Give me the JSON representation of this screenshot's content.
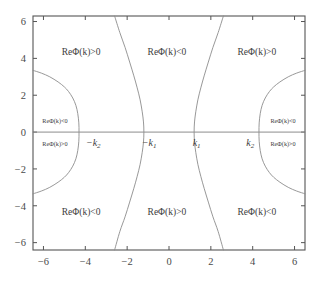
{
  "figure": {
    "kind": "sign-region-plot",
    "background_color": "#ffffff",
    "frame_color": "#555555",
    "curve_color": "#8c8c8c",
    "axis_color": "#8c8c8c",
    "text_color": "#3d3d3d"
  },
  "chart_data": {
    "type": "line",
    "title": "",
    "xlabel": "",
    "ylabel": "",
    "xlim": [
      -6.5,
      6.5
    ],
    "ylim": [
      -6.4,
      6.3
    ],
    "grid": false,
    "legend": "none",
    "xticks": [
      "-6",
      "-4",
      "-2",
      "0",
      "2",
      "4",
      "6"
    ],
    "xtick_values": [
      -6,
      -4,
      -2,
      0,
      2,
      4,
      6
    ],
    "yticks": [
      "6",
      "4",
      "2",
      "0",
      "-2",
      "-4",
      "-6"
    ],
    "ytick_values": [
      6,
      4,
      2,
      0,
      -2,
      -4,
      -6
    ],
    "series": [
      {
        "name": "left-arc",
        "description": "leftward-opening arc with vertex on the real axis near x=-4.3, meeting the left frame edge at y=+3.35 and y=-3.35",
        "points": [
          [
            -6.5,
            3.35
          ],
          [
            -6.1,
            3.2
          ],
          [
            -5.7,
            3.0
          ],
          [
            -5.3,
            2.72
          ],
          [
            -5.0,
            2.45
          ],
          [
            -4.8,
            2.2
          ],
          [
            -4.6,
            1.85
          ],
          [
            -4.45,
            1.45
          ],
          [
            -4.36,
            1.0
          ],
          [
            -4.31,
            0.5
          ],
          [
            -4.3,
            0.0
          ],
          [
            -4.31,
            -0.5
          ],
          [
            -4.36,
            -1.0
          ],
          [
            -4.45,
            -1.45
          ],
          [
            -4.6,
            -1.85
          ],
          [
            -4.8,
            -2.2
          ],
          [
            -5.0,
            -2.45
          ],
          [
            -5.3,
            -2.72
          ],
          [
            -5.7,
            -3.0
          ],
          [
            -6.1,
            -3.2
          ],
          [
            -6.5,
            -3.35
          ]
        ]
      },
      {
        "name": "inner-left-curve",
        "description": "S-shaped separatrix crossing the real axis at -k1 (x=-1.2), running to x=-2.55 at both top and bottom frame edges",
        "points": [
          [
            -2.6,
            6.3
          ],
          [
            -2.35,
            5.4
          ],
          [
            -2.1,
            4.6
          ],
          [
            -1.88,
            3.8
          ],
          [
            -1.68,
            3.05
          ],
          [
            -1.52,
            2.4
          ],
          [
            -1.38,
            1.75
          ],
          [
            -1.28,
            1.1
          ],
          [
            -1.22,
            0.55
          ],
          [
            -1.2,
            0.0
          ],
          [
            -1.22,
            -0.55
          ],
          [
            -1.28,
            -1.1
          ],
          [
            -1.38,
            -1.75
          ],
          [
            -1.52,
            -2.4
          ],
          [
            -1.68,
            -3.05
          ],
          [
            -1.88,
            -3.8
          ],
          [
            -2.1,
            -4.6
          ],
          [
            -2.35,
            -5.4
          ],
          [
            -2.6,
            -6.4
          ]
        ]
      },
      {
        "name": "inner-right-curve",
        "description": "S-shaped separatrix crossing the real axis at k1 (x=1.2), running to x=2.55 at both top and bottom frame edges",
        "points": [
          [
            2.6,
            6.3
          ],
          [
            2.35,
            5.4
          ],
          [
            2.1,
            4.6
          ],
          [
            1.88,
            3.8
          ],
          [
            1.68,
            3.05
          ],
          [
            1.52,
            2.4
          ],
          [
            1.38,
            1.75
          ],
          [
            1.28,
            1.1
          ],
          [
            1.22,
            0.55
          ],
          [
            1.2,
            0.0
          ],
          [
            1.22,
            -0.55
          ],
          [
            1.28,
            -1.1
          ],
          [
            1.38,
            -1.75
          ],
          [
            1.52,
            -2.4
          ],
          [
            1.68,
            -3.05
          ],
          [
            1.88,
            -3.8
          ],
          [
            2.1,
            -4.6
          ],
          [
            2.35,
            -5.4
          ],
          [
            2.6,
            -6.4
          ]
        ]
      },
      {
        "name": "right-arc",
        "description": "rightward-opening arc with vertex on the real axis near x=4.3, meeting the right frame edge at y=+3.35 and y=-3.35",
        "points": [
          [
            6.5,
            3.35
          ],
          [
            6.1,
            3.2
          ],
          [
            5.7,
            3.0
          ],
          [
            5.3,
            2.72
          ],
          [
            5.0,
            2.45
          ],
          [
            4.8,
            2.2
          ],
          [
            4.6,
            1.85
          ],
          [
            4.45,
            1.45
          ],
          [
            4.36,
            1.0
          ],
          [
            4.31,
            0.5
          ],
          [
            4.3,
            0.0
          ],
          [
            4.31,
            -0.5
          ],
          [
            4.36,
            -1.0
          ],
          [
            4.45,
            -1.45
          ],
          [
            4.6,
            -1.85
          ],
          [
            4.8,
            -2.2
          ],
          [
            5.0,
            -2.45
          ],
          [
            5.3,
            -2.72
          ],
          [
            5.7,
            -3.0
          ],
          [
            6.1,
            -3.2
          ],
          [
            6.5,
            -3.35
          ]
        ]
      },
      {
        "name": "real-axis",
        "description": "horizontal line y=0 spanning the full frame",
        "points": [
          [
            -6.5,
            0.0
          ],
          [
            6.5,
            0.0
          ]
        ]
      }
    ],
    "annotations": [
      {
        "name": "top-left-region",
        "text": "ReΦ(k)>0",
        "x": -4.2,
        "y": 4.35,
        "size": "normal"
      },
      {
        "name": "top-middle-region",
        "text": "ReΦ(k)<0",
        "x": -0.1,
        "y": 4.35,
        "size": "normal"
      },
      {
        "name": "top-right-region",
        "text": "ReΦ(k)>0",
        "x": 4.2,
        "y": 4.35,
        "size": "normal"
      },
      {
        "name": "bottom-left-region",
        "text": "ReΦ(k)<0",
        "x": -4.2,
        "y": -4.3,
        "size": "normal"
      },
      {
        "name": "bottom-middle-region",
        "text": "ReΦ(k)>0",
        "x": -0.1,
        "y": -4.3,
        "size": "normal"
      },
      {
        "name": "bottom-right-region",
        "text": "ReΦ(k)<0",
        "x": 4.2,
        "y": -4.3,
        "size": "normal"
      },
      {
        "name": "left-pocket-upper",
        "text": "ReΦ(k)<0",
        "x": -5.45,
        "y": 0.62,
        "size": "small"
      },
      {
        "name": "left-pocket-lower",
        "text": "ReΦ(k)>0",
        "x": -5.45,
        "y": -0.62,
        "size": "small"
      },
      {
        "name": "right-pocket-upper",
        "text": "ReΦ(k)<0",
        "x": 5.45,
        "y": 0.62,
        "size": "small"
      },
      {
        "name": "right-pocket-lower",
        "text": "ReΦ(k)>0",
        "x": 5.45,
        "y": -0.62,
        "size": "small"
      }
    ],
    "point_labels": [
      {
        "name": "minus-k2",
        "base": "−k",
        "sub": "2",
        "x": -3.62,
        "y": -0.55
      },
      {
        "name": "minus-k1",
        "base": "−k",
        "sub": "1",
        "x": -0.95,
        "y": -0.55
      },
      {
        "name": "plus-k1",
        "base": "k",
        "sub": "1",
        "x": 1.32,
        "y": -0.55
      },
      {
        "name": "plus-k2",
        "base": "k",
        "sub": "2",
        "x": 3.88,
        "y": -0.55
      }
    ]
  }
}
